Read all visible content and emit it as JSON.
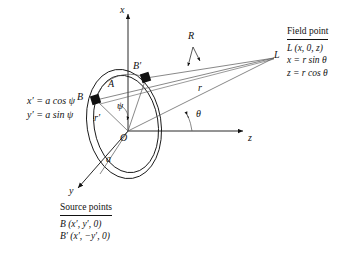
{
  "figure": {
    "axes": {
      "x_label": "x",
      "y_label": "y",
      "z_label": "z"
    },
    "points": {
      "origin_label": "O",
      "source_b_label": "B",
      "source_b_prime_label": "B′",
      "field_point_label": "L"
    },
    "annotations": {
      "arc_label": "A",
      "ring_radius_label": "a",
      "source_radius_label": "r′",
      "field_distance_label": "r",
      "separation_label": "R",
      "polar_angle_label": "θ",
      "azimuth_angle_label": "ψ"
    },
    "parametric": {
      "line1_lhs": "x′",
      "line1_rhs": "= a cos ψ",
      "line2_lhs": "y′",
      "line2_rhs": "= a sin ψ",
      "line1_full": "x′ = a cos ψ",
      "line2_full": "y′ = a sin ψ"
    },
    "field_point_box": {
      "title": "Field point",
      "rows": [
        "L (x, 0, z)",
        "x = r sin θ",
        "z = r cos θ"
      ]
    },
    "source_points_box": {
      "title": "Source points",
      "rows": [
        "B (x′, y′, 0)",
        "B′ (x′, −y′, 0)"
      ]
    },
    "colors": {
      "ink": "#111111",
      "ray": "#555555",
      "background": "#ffffff"
    }
  }
}
